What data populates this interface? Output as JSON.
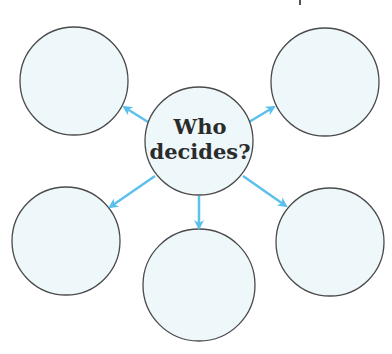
{
  "diagram": {
    "type": "spider-map",
    "center": {
      "line1": "Who",
      "line2": "decides?",
      "cx": 199,
      "cy": 141,
      "r": 54
    },
    "outer_nodes": [
      {
        "id": "top-left",
        "label": "",
        "cx": 74,
        "cy": 81,
        "r": 54
      },
      {
        "id": "top-right",
        "label": "",
        "cx": 325,
        "cy": 82,
        "r": 54
      },
      {
        "id": "bottom-left",
        "label": "",
        "cx": 66,
        "cy": 241,
        "r": 54
      },
      {
        "id": "bottom-center",
        "label": "",
        "cx": 199,
        "cy": 285,
        "r": 56
      },
      {
        "id": "bottom-right",
        "label": "",
        "cx": 330,
        "cy": 242,
        "r": 54
      }
    ],
    "colors": {
      "circle_fill": "#eef8fb",
      "circle_stroke": "#4a4a4a",
      "arrow": "#5bc0ec",
      "text": "#2b2b2b"
    },
    "top_cutoff_glyph": "p"
  }
}
